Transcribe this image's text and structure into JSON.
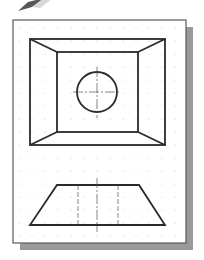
{
  "figure": {
    "colors": {
      "background": "#ffffff",
      "paper": "#ffffff",
      "paper_border": "#5a5a5a",
      "shadow": "#9a9a9a",
      "object_line": "#2a2a2a",
      "thin_line": "#555555",
      "grid_dot": "#c8c8c8",
      "pencil": "#3a3a3a"
    },
    "paper": {
      "x": 13,
      "y": 20,
      "width": 173,
      "height": 223
    },
    "shadow_offset": {
      "dx": 7,
      "dy": 7
    },
    "grid": {
      "spacing": 13,
      "dot_radius": 0.6
    },
    "top_view": {
      "outer_rect": {
        "x1": 30,
        "y1": 39,
        "x2": 165,
        "y2": 145
      },
      "inner_rect": {
        "x1": 57,
        "y1": 52,
        "x2": 138,
        "y2": 132
      },
      "hole": {
        "cx": 97,
        "cy": 92,
        "r": 20
      },
      "centerline_h": {
        "x1": 73,
        "x2": 121,
        "y": 92
      },
      "centerline_v": {
        "x": 97,
        "y1": 67,
        "y2": 118
      }
    },
    "front_view": {
      "trapezoid": {
        "top_left": [
          57,
          185
        ],
        "top_right": [
          139,
          185
        ],
        "bottom_right": [
          165,
          225
        ],
        "bottom_left": [
          30,
          225
        ]
      },
      "hidden_lines_x": [
        78,
        118
      ],
      "centerline": {
        "x": 97,
        "y1": 178,
        "y2": 232
      }
    },
    "pencil_icon": {
      "tip": [
        18,
        11
      ]
    }
  }
}
